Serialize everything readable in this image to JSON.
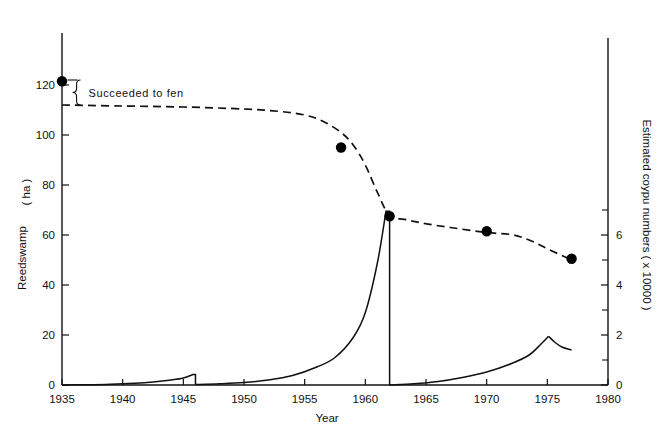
{
  "chart_data": {
    "type": "line",
    "title": "",
    "xlabel": "Year",
    "ylabel_left": "Reedswamp    ( ha )",
    "ylabel_left_main": "Reedswamp",
    "ylabel_left_unit": "( ha )",
    "ylabel_right": "Estimated coypu numbers  ( x 10000 )",
    "xlim": [
      1935,
      1980
    ],
    "ylim_left": [
      0,
      130
    ],
    "ylim_right": [
      0,
      7.2
    ],
    "xticks": [
      1935,
      1940,
      1945,
      1950,
      1955,
      1960,
      1965,
      1970,
      1975,
      1980
    ],
    "xtick_labels": [
      "1935",
      "1940",
      "1945",
      "1950",
      "1955",
      "1960",
      "1965",
      "1970",
      "1975",
      "1980"
    ],
    "yticks_left": [
      0,
      20,
      40,
      60,
      80,
      100,
      120
    ],
    "ytick_labels_left": [
      "0",
      "20",
      "40",
      "60",
      "80",
      "100",
      "120"
    ],
    "yticks_right": [
      0,
      2,
      4,
      6
    ],
    "ytick_labels_right": [
      "0",
      "2",
      "4",
      "6"
    ],
    "yticks_right_minor": [
      1,
      3,
      5,
      7
    ],
    "grid": false,
    "legend": "none",
    "annotations": [
      {
        "text": "Succeeded to fen",
        "x": 1936.2,
        "y_top": 122,
        "y_bottom": 112,
        "brace": true
      }
    ],
    "series": [
      {
        "name": "Reedswamp area",
        "axis": "left",
        "style": "dashed",
        "unit": "ha",
        "points": [
          {
            "x": 1935.0,
            "y": 112.0
          },
          {
            "x": 1940.0,
            "y": 111.6
          },
          {
            "x": 1945.0,
            "y": 111.2
          },
          {
            "x": 1950.0,
            "y": 110.4
          },
          {
            "x": 1953.0,
            "y": 109.4
          },
          {
            "x": 1955.0,
            "y": 108.0
          },
          {
            "x": 1956.5,
            "y": 105.5
          },
          {
            "x": 1958.0,
            "y": 101.0
          },
          {
            "x": 1959.0,
            "y": 96.0
          },
          {
            "x": 1960.0,
            "y": 88.0
          },
          {
            "x": 1961.0,
            "y": 77.0
          },
          {
            "x": 1962.0,
            "y": 68.0
          },
          {
            "x": 1963.5,
            "y": 66.0
          },
          {
            "x": 1965.0,
            "y": 64.5
          },
          {
            "x": 1967.0,
            "y": 63.0
          },
          {
            "x": 1970.0,
            "y": 61.0
          },
          {
            "x": 1972.0,
            "y": 60.2
          },
          {
            "x": 1973.5,
            "y": 58.0
          },
          {
            "x": 1975.0,
            "y": 54.5
          },
          {
            "x": 1977.0,
            "y": 50.0
          }
        ],
        "markers": [
          {
            "x": 1935.0,
            "y": 121.5,
            "label": "1935"
          },
          {
            "x": 1958.0,
            "y": 95.0,
            "label": "1958"
          },
          {
            "x": 1962.0,
            "y": 67.5,
            "label": "1962"
          },
          {
            "x": 1970.0,
            "y": 61.5,
            "label": "1970"
          },
          {
            "x": 1977.0,
            "y": 50.5,
            "label": "1977"
          }
        ]
      },
      {
        "name": "Estimated coypu numbers",
        "axis": "right",
        "style": "solid",
        "unit": "x 10000",
        "segments": [
          {
            "name": "first-irruption-1935-1946",
            "points": [
              {
                "x": 1935.0,
                "y": 0.0
              },
              {
                "x": 1937.0,
                "y": 0.01
              },
              {
                "x": 1939.0,
                "y": 0.03
              },
              {
                "x": 1941.0,
                "y": 0.07
              },
              {
                "x": 1942.5,
                "y": 0.12
              },
              {
                "x": 1944.0,
                "y": 0.2
              },
              {
                "x": 1945.0,
                "y": 0.28
              },
              {
                "x": 1945.8,
                "y": 0.42
              }
            ],
            "crash_to": 0.02,
            "crash_year": 1946.0
          },
          {
            "name": "second-irruption-1946-1962",
            "points": [
              {
                "x": 1946.0,
                "y": 0.02
              },
              {
                "x": 1948.0,
                "y": 0.05
              },
              {
                "x": 1950.0,
                "y": 0.1
              },
              {
                "x": 1952.0,
                "y": 0.2
              },
              {
                "x": 1954.0,
                "y": 0.38
              },
              {
                "x": 1956.0,
                "y": 0.72
              },
              {
                "x": 1957.5,
                "y": 1.1
              },
              {
                "x": 1959.0,
                "y": 1.9
              },
              {
                "x": 1960.0,
                "y": 2.9
              },
              {
                "x": 1961.0,
                "y": 4.9
              },
              {
                "x": 1961.7,
                "y": 6.95
              }
            ],
            "crash_to": 0.0,
            "crash_year": 1962.0
          },
          {
            "name": "third-irruption-1962-1977",
            "points": [
              {
                "x": 1962.0,
                "y": 0.0
              },
              {
                "x": 1964.0,
                "y": 0.05
              },
              {
                "x": 1966.0,
                "y": 0.14
              },
              {
                "x": 1968.0,
                "y": 0.3
              },
              {
                "x": 1970.0,
                "y": 0.52
              },
              {
                "x": 1972.0,
                "y": 0.85
              },
              {
                "x": 1973.5,
                "y": 1.2
              },
              {
                "x": 1974.5,
                "y": 1.65
              },
              {
                "x": 1975.1,
                "y": 1.95
              }
            ],
            "decline": [
              {
                "x": 1975.1,
                "y": 1.95
              },
              {
                "x": 1975.6,
                "y": 1.72
              },
              {
                "x": 1976.2,
                "y": 1.52
              },
              {
                "x": 1977.0,
                "y": 1.4
              }
            ]
          }
        ]
      }
    ],
    "colors": {
      "line": "#111111",
      "marker": "#000000",
      "axis": "#111111",
      "background": "#ffffff"
    }
  }
}
